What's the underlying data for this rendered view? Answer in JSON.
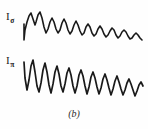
{
  "figure": {
    "caption": "(b)",
    "background_color": "#fefefe",
    "trace_color": "#1a1a1a",
    "labels": {
      "upper": {
        "base": "I",
        "subscript": "σ",
        "full": "Iσ"
      },
      "lower": {
        "base": "I",
        "subscript": "π",
        "full": "Iπ"
      }
    }
  },
  "chart_data": {
    "type": "line",
    "title": "",
    "subtitle": "",
    "xlabel": "",
    "ylabel": "",
    "grid": false,
    "legend": "none",
    "annotations": [
      "Iσ",
      "Iπ",
      "(b)"
    ],
    "xlim": [
      0,
      148
    ],
    "ylim": [
      0,
      108
    ],
    "series": [
      {
        "name": "Iσ",
        "label": "Iσ",
        "color": "#1a1a1a",
        "stroke_width": 1.6,
        "points": [
          [
            24,
            24
          ],
          [
            24,
            40
          ],
          [
            25,
            30
          ],
          [
            27,
            22
          ],
          [
            29,
            16
          ],
          [
            31,
            13
          ],
          [
            33,
            19
          ],
          [
            35,
            25
          ],
          [
            36,
            22
          ],
          [
            38,
            15
          ],
          [
            40,
            12
          ],
          [
            42,
            18
          ],
          [
            44,
            27
          ],
          [
            46,
            33
          ],
          [
            48,
            29
          ],
          [
            50,
            22
          ],
          [
            52,
            18
          ],
          [
            54,
            22
          ],
          [
            56,
            29
          ],
          [
            58,
            33
          ],
          [
            60,
            30
          ],
          [
            62,
            23
          ],
          [
            64,
            19
          ],
          [
            66,
            23
          ],
          [
            68,
            30
          ],
          [
            70,
            34
          ],
          [
            72,
            31
          ],
          [
            74,
            25
          ],
          [
            76,
            21
          ],
          [
            78,
            25
          ],
          [
            80,
            31
          ],
          [
            82,
            35
          ],
          [
            84,
            33
          ],
          [
            86,
            27
          ],
          [
            88,
            24
          ],
          [
            90,
            27
          ],
          [
            92,
            33
          ],
          [
            94,
            36
          ],
          [
            96,
            34
          ],
          [
            98,
            29
          ],
          [
            100,
            26
          ],
          [
            102,
            29
          ],
          [
            104,
            34
          ],
          [
            106,
            37
          ],
          [
            108,
            35
          ],
          [
            110,
            31
          ],
          [
            112,
            28
          ],
          [
            114,
            30
          ],
          [
            116,
            35
          ],
          [
            118,
            38
          ],
          [
            120,
            36
          ],
          [
            122,
            32
          ],
          [
            124,
            30
          ],
          [
            126,
            32
          ],
          [
            128,
            36
          ],
          [
            130,
            39
          ],
          [
            132,
            38
          ],
          [
            134,
            35
          ],
          [
            136,
            33
          ],
          [
            138,
            35
          ],
          [
            140,
            38
          ],
          [
            142,
            40
          ]
        ]
      },
      {
        "name": "Iπ",
        "label": "Iπ",
        "color": "#1a1a1a",
        "stroke_width": 1.7,
        "points": [
          [
            24,
            62
          ],
          [
            25,
            78
          ],
          [
            27,
            90
          ],
          [
            29,
            80
          ],
          [
            31,
            66
          ],
          [
            33,
            60
          ],
          [
            35,
            72
          ],
          [
            37,
            86
          ],
          [
            39,
            92
          ],
          [
            41,
            83
          ],
          [
            43,
            70
          ],
          [
            45,
            63
          ],
          [
            47,
            72
          ],
          [
            49,
            85
          ],
          [
            51,
            93
          ],
          [
            53,
            84
          ],
          [
            55,
            72
          ],
          [
            57,
            66
          ],
          [
            59,
            74
          ],
          [
            61,
            86
          ],
          [
            63,
            92
          ],
          [
            65,
            84
          ],
          [
            67,
            73
          ],
          [
            69,
            68
          ],
          [
            71,
            75
          ],
          [
            73,
            86
          ],
          [
            75,
            93
          ],
          [
            77,
            86
          ],
          [
            79,
            75
          ],
          [
            81,
            70
          ],
          [
            83,
            76
          ],
          [
            85,
            86
          ],
          [
            87,
            94
          ],
          [
            89,
            87
          ],
          [
            91,
            77
          ],
          [
            93,
            72
          ],
          [
            95,
            78
          ],
          [
            97,
            87
          ],
          [
            99,
            94
          ],
          [
            101,
            88
          ],
          [
            103,
            79
          ],
          [
            105,
            74
          ],
          [
            107,
            80
          ],
          [
            109,
            88
          ],
          [
            111,
            95
          ],
          [
            113,
            89
          ],
          [
            115,
            81
          ],
          [
            117,
            76
          ],
          [
            119,
            82
          ],
          [
            121,
            89
          ],
          [
            123,
            95
          ],
          [
            125,
            90
          ],
          [
            127,
            83
          ],
          [
            129,
            79
          ],
          [
            131,
            84
          ],
          [
            133,
            90
          ],
          [
            135,
            96
          ],
          [
            137,
            91
          ],
          [
            139,
            85
          ],
          [
            141,
            82
          ],
          [
            143,
            86
          ]
        ]
      }
    ]
  }
}
